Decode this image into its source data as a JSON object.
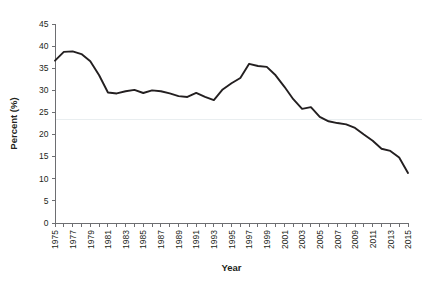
{
  "chart_data": {
    "type": "line",
    "title": "",
    "xlabel": "Year",
    "ylabel": "Percent (%)",
    "xlim": [
      1975,
      2015
    ],
    "ylim": [
      0,
      45
    ],
    "grid": false,
    "legend": "none",
    "y_ticks": [
      0,
      5,
      10,
      15,
      20,
      25,
      30,
      35,
      40,
      45
    ],
    "y_tick_labels": [
      "0",
      "5",
      "10",
      "15",
      "20",
      "25",
      "30",
      "35",
      "40",
      "45"
    ],
    "x_ticks": [
      1975,
      1976,
      1977,
      1978,
      1979,
      1980,
      1981,
      1982,
      1983,
      1984,
      1985,
      1986,
      1987,
      1988,
      1989,
      1990,
      1991,
      1992,
      1993,
      1994,
      1995,
      1996,
      1997,
      1998,
      1999,
      2000,
      2001,
      2002,
      2003,
      2004,
      2005,
      2006,
      2007,
      2008,
      2009,
      2010,
      2011,
      2012,
      2013,
      2014,
      2015
    ],
    "x_tick_labels": [
      "1975",
      "",
      "1977",
      "",
      "1979",
      "",
      "1981",
      "",
      "1983",
      "",
      "1985",
      "",
      "1987",
      "",
      "1989",
      "",
      "1991",
      "",
      "1993",
      "",
      "1995",
      "",
      "1997",
      "",
      "1999",
      "",
      "2001",
      "",
      "2003",
      "",
      "2005",
      "",
      "2007",
      "",
      "2009",
      "",
      "2011",
      "",
      "2013",
      "",
      "2015"
    ],
    "reference_line": 23.5,
    "series": [
      {
        "name": "Percent",
        "x": [
          1975,
          1976,
          1977,
          1978,
          1979,
          1980,
          1981,
          1982,
          1983,
          1984,
          1985,
          1986,
          1987,
          1988,
          1989,
          1990,
          1991,
          1992,
          1993,
          1994,
          1995,
          1996,
          1997,
          1998,
          1999,
          2000,
          2001,
          2002,
          2003,
          2004,
          2005,
          2006,
          2007,
          2008,
          2009,
          2010,
          2011,
          2012,
          2013,
          2014,
          2015
        ],
        "values": [
          36.7,
          38.7,
          38.8,
          38.2,
          36.6,
          33.4,
          29.5,
          29.3,
          29.8,
          30.1,
          29.4,
          30.0,
          29.8,
          29.3,
          28.7,
          28.5,
          29.4,
          28.5,
          27.8,
          30.2,
          31.6,
          32.8,
          36.0,
          35.5,
          35.3,
          33.4,
          30.8,
          28.0,
          25.8,
          26.2,
          24.0,
          23.0,
          22.6,
          22.3,
          21.5,
          20.0,
          18.6,
          16.8,
          16.3,
          14.8,
          11.3
        ]
      }
    ]
  },
  "geometry": {
    "plot_left": 55,
    "plot_right": 408,
    "plot_top": 24,
    "plot_bottom": 223
  }
}
